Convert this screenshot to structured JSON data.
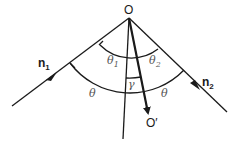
{
  "diagram": {
    "points": {
      "apex": "O",
      "end": "O′"
    },
    "rays": {
      "incoming": {
        "symbol": "n",
        "subscript": "1"
      },
      "outgoing": {
        "symbol": "n",
        "subscript": "2"
      }
    },
    "angles": {
      "theta1": {
        "symbol": "θ",
        "subscript": "1"
      },
      "theta2": {
        "symbol": "θ",
        "subscript": "2"
      },
      "gamma": "γ",
      "theta_left": "θ",
      "theta_right": "θ"
    }
  }
}
